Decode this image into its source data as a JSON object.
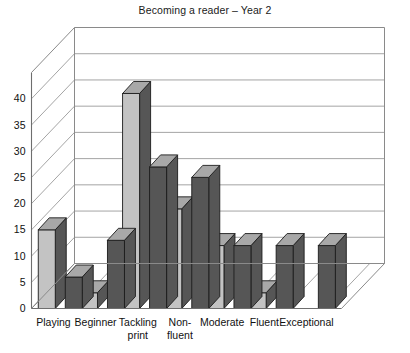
{
  "chart_data": {
    "type": "bar",
    "title": "Becoming a reader – Year 2",
    "subtitle": "",
    "xlabel": "",
    "ylabel": "",
    "categories": [
      "Playing",
      "Beginner",
      "Tackling print",
      "Non-fluent",
      "Moderate",
      "Fluent",
      "Exceptional"
    ],
    "category_lines": [
      [
        "Playing"
      ],
      [
        "Beginner"
      ],
      [
        "Tackling",
        "print"
      ],
      [
        "Non-",
        "fluent"
      ],
      [
        "Moderate"
      ],
      [
        "Fluent"
      ],
      [
        "Exceptional"
      ]
    ],
    "series": [
      {
        "name": "Series 1",
        "values": [
          15,
          3,
          41,
          19,
          12,
          3,
          0
        ]
      },
      {
        "name": "Series 2",
        "values": [
          6,
          13,
          27,
          25,
          12,
          12,
          12
        ]
      }
    ],
    "ylim": [
      0,
      45
    ],
    "yticks": [
      0,
      5,
      10,
      15,
      20,
      25,
      30,
      35,
      40
    ],
    "ytick_labels": [
      "0",
      "5",
      "10",
      "15",
      "20",
      "25",
      "30",
      "35",
      "40"
    ],
    "grid": true,
    "grid_axis": "y",
    "legend": false,
    "legend_position": "none",
    "projection": "3d",
    "colors": {
      "bar_front": "#565656",
      "bar_side": "#c3c3c3",
      "bar_top": "#a8a8a8",
      "bar_outline": "#1c1c1c",
      "gridline": "#9a9a9a",
      "axis": "#6e6e6e",
      "background": "#ffffff",
      "text": "#111111"
    }
  }
}
